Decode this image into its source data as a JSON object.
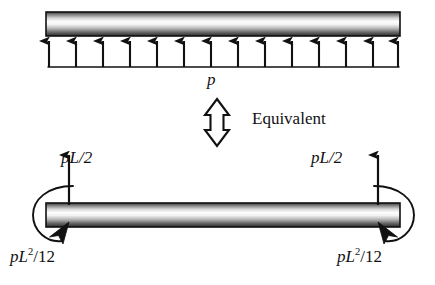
{
  "figure": {
    "type": "structural-beam-diagram",
    "ink_color": "#111111",
    "background_color": "#ffffff"
  },
  "top_diagram": {
    "name": "distributed-load-beam",
    "beam": {
      "x_left": 46,
      "x_right": 400,
      "y_top": 12,
      "y_bottom": 36,
      "shading": "horizontal-cylinder-gradient"
    },
    "load": {
      "label": "p",
      "arrow_count": 14,
      "direction": "up",
      "baseline_y": 67,
      "arrow_tip_y": 38
    }
  },
  "middle": {
    "equivalence_arrow": {
      "name": "double-headed-vertical-arrow",
      "direction": "up-down",
      "x_center": 217,
      "y_top": 99,
      "y_bottom": 146
    },
    "label": "Equivalent"
  },
  "bottom_diagram": {
    "name": "fixed-end-reactions-beam",
    "beam": {
      "x_left": 46,
      "x_right": 400,
      "y_top": 203,
      "y_bottom": 227,
      "shading": "horizontal-cylinder-gradient"
    },
    "reactions": [
      {
        "name": "left-vertical-reaction",
        "label": "pL/2",
        "direction": "up",
        "x": 69,
        "y_base": 205,
        "y_tip": 152
      },
      {
        "name": "right-vertical-reaction",
        "label": "pL/2",
        "direction": "up",
        "x": 378,
        "y_base": 205,
        "y_tip": 152
      }
    ],
    "moments": [
      {
        "name": "left-end-moment",
        "label_parts": {
          "base": "pL",
          "exponent": "2",
          "divisor": "/12"
        },
        "label": "pL2/12",
        "sense": "counterclockwise-arc",
        "side": "left"
      },
      {
        "name": "right-end-moment",
        "label_parts": {
          "base": "pL",
          "exponent": "2",
          "divisor": "/12"
        },
        "label": "pL2/12",
        "sense": "clockwise-arc",
        "side": "right"
      }
    ]
  }
}
